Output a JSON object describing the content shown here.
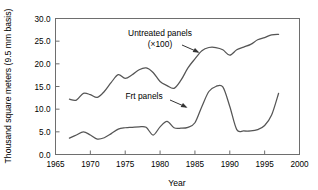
{
  "chart_data": {
    "type": "line",
    "title": "",
    "xlabel": "Year",
    "ylabel": "Thousand square meters (9.5 mm basis)",
    "xlim": [
      1965,
      2000
    ],
    "ylim": [
      0.0,
      30.0
    ],
    "grid": false,
    "legend_position": "inline-annotations",
    "xticks": [
      "1965",
      "1970",
      "1975",
      "1980",
      "1985",
      "1990",
      "1995",
      "2000"
    ],
    "xtick_values": [
      1965,
      1970,
      1975,
      1980,
      1985,
      1990,
      1995,
      2000
    ],
    "yticks": [
      "0.0",
      "5.0",
      "10.0",
      "15.0",
      "20.0",
      "25.0",
      "30.0"
    ],
    "ytick_values": [
      0.0,
      5.0,
      10.0,
      15.0,
      20.0,
      25.0,
      30.0
    ],
    "annotations": [
      {
        "name": "untreated-panels-annotation",
        "text_line1": "Untreated panels",
        "text_line2": "(×100)",
        "points_to_series": "Untreated panels (×100)"
      },
      {
        "name": "frt-panels-annotation",
        "text_line1": "Frt panels",
        "text_line2": "",
        "points_to_series": "Frt panels"
      }
    ],
    "x": [
      1967,
      1968,
      1969,
      1970,
      1971,
      1972,
      1973,
      1974,
      1975,
      1976,
      1977,
      1978,
      1979,
      1980,
      1981,
      1982,
      1983,
      1984,
      1985,
      1986,
      1987,
      1988,
      1989,
      1990,
      1991,
      1992,
      1993,
      1994,
      1995,
      1996,
      1997
    ],
    "series": [
      {
        "name": "Untreated panels (×100)",
        "values": [
          12.2,
          12.0,
          13.5,
          13.2,
          12.6,
          13.9,
          15.9,
          17.6,
          16.8,
          17.6,
          18.7,
          19.1,
          18.1,
          16.1,
          15.2,
          14.6,
          16.4,
          19.1,
          21.1,
          22.9,
          23.6,
          23.6,
          23.1,
          21.9,
          23.1,
          23.7,
          24.3,
          25.3,
          25.8,
          26.4,
          26.5
        ]
      },
      {
        "name": "Frt panels",
        "values": [
          3.6,
          4.3,
          5.0,
          4.3,
          3.4,
          3.7,
          4.6,
          5.6,
          5.9,
          6.0,
          6.1,
          6.0,
          4.3,
          6.1,
          7.3,
          5.9,
          5.8,
          6.0,
          7.0,
          10.6,
          13.9,
          15.0,
          14.9,
          10.6,
          5.5,
          5.2,
          5.2,
          5.5,
          6.4,
          8.7,
          13.5
        ]
      }
    ]
  }
}
